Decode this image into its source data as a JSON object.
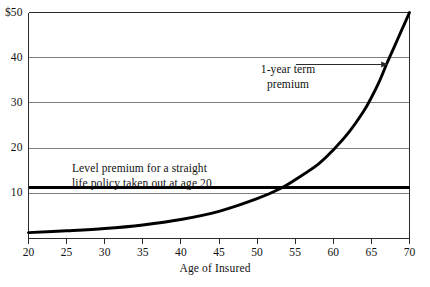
{
  "chart_data": {
    "type": "line",
    "title": "",
    "xlabel": "Age of Insured",
    "ylabel": "",
    "xlim": [
      20,
      70
    ],
    "ylim": [
      0,
      50
    ],
    "grid": true,
    "grid_axis": "y",
    "legend": "none",
    "x_ticks": [
      20,
      25,
      30,
      35,
      40,
      45,
      50,
      55,
      60,
      65,
      70
    ],
    "x_tick_labels": [
      "20",
      "25",
      "30",
      "35",
      "40",
      "45",
      "50",
      "55",
      "60",
      "65",
      "70"
    ],
    "y_ticks": [
      10,
      20,
      30,
      40,
      50
    ],
    "y_tick_labels": [
      "10",
      "20",
      "30",
      "40",
      "$50"
    ],
    "currency_symbol": "$",
    "series": [
      {
        "name": "1-year term premium",
        "style": "curve",
        "x": [
          20,
          25,
          30,
          35,
          40,
          45,
          50,
          53,
          55,
          58,
          60,
          62,
          64,
          65,
          66,
          67,
          68,
          69,
          70
        ],
        "values": [
          1.3,
          1.7,
          2.2,
          3.0,
          4.2,
          6.0,
          8.8,
          11.0,
          13.0,
          16.4,
          19.6,
          23.4,
          28.2,
          31.2,
          34.6,
          38.6,
          42.4,
          46.2,
          50.0
        ]
      },
      {
        "name": "Level premium for a straight life policy taken out at age 20",
        "style": "horizontal-line",
        "x": [
          20,
          70
        ],
        "values": [
          11.2,
          11.2
        ]
      }
    ],
    "annotations": [
      {
        "name": "term-premium-label",
        "text": "1-year term\npremium",
        "x": 57.5,
        "y": 41,
        "arrow_to_x": 67.2,
        "arrow_to_y": 38.5
      },
      {
        "name": "level-premium-label",
        "text": "Level premium for a straight\nlife policy taken out at age 20",
        "x": 27,
        "y": 17.5
      }
    ],
    "crossover": {
      "age": 53,
      "premium": 11.2
    }
  },
  "colors": {
    "background": "#ffffff",
    "axis": "#2b2b2b",
    "gridline": "#808080",
    "curve": "#000000",
    "level_line": "#000000",
    "text": "#111111"
  },
  "axis": {
    "x_title": "Age of Insured"
  },
  "y_tick_labels": [
    {
      "value": 50,
      "label": "$50"
    },
    {
      "value": 40,
      "label": "40"
    },
    {
      "value": 30,
      "label": "30"
    },
    {
      "value": 20,
      "label": "20"
    },
    {
      "value": 10,
      "label": "10"
    }
  ],
  "x_tick_labels": [
    {
      "value": 20,
      "label": "20"
    },
    {
      "value": 25,
      "label": "25"
    },
    {
      "value": 30,
      "label": "30"
    },
    {
      "value": 35,
      "label": "35"
    },
    {
      "value": 40,
      "label": "40"
    },
    {
      "value": 45,
      "label": "45"
    },
    {
      "value": 50,
      "label": "50"
    },
    {
      "value": 55,
      "label": "55"
    },
    {
      "value": 60,
      "label": "60"
    },
    {
      "value": 65,
      "label": "65"
    },
    {
      "value": 70,
      "label": "70"
    }
  ],
  "annotations": {
    "term": "1-year term\npremium",
    "level": "Level premium for a straight\nlife policy taken out at age 20"
  }
}
